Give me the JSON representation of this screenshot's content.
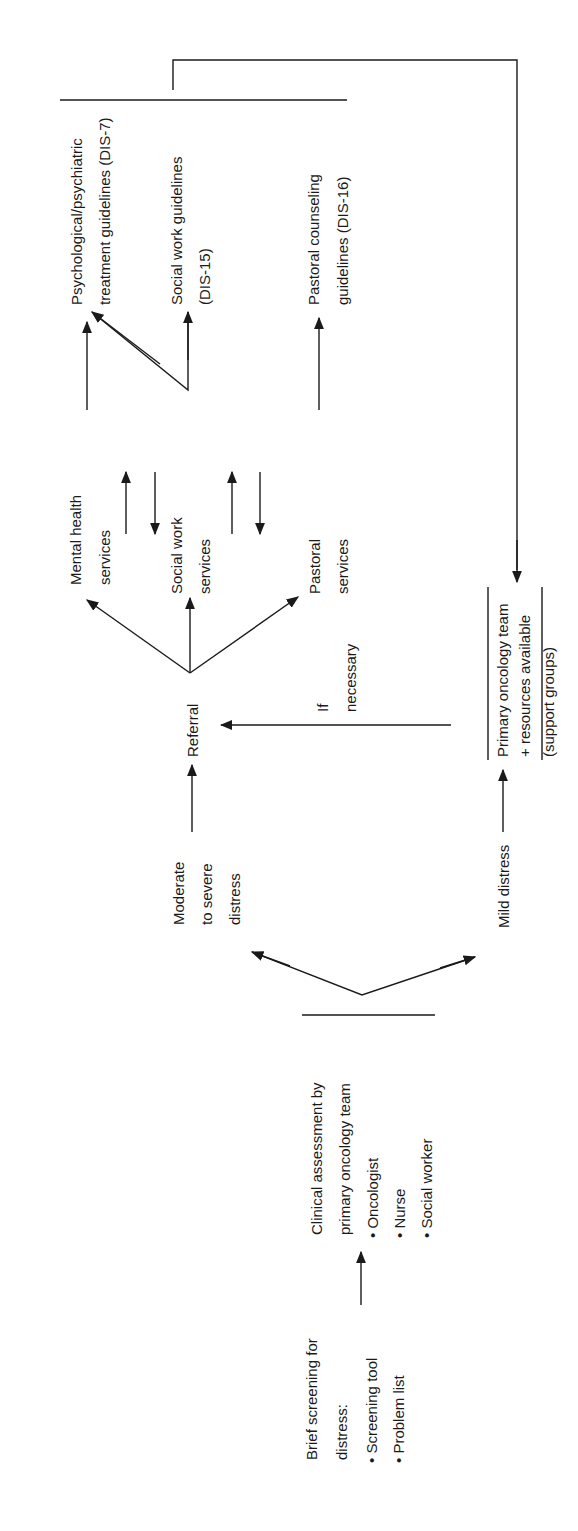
{
  "diagram": {
    "orientation": "rotated -90deg (reads bottom-to-top)",
    "nodes": {
      "screening": {
        "title_lines": [
          "Brief screening for",
          "distress:"
        ],
        "bullets": [
          "• Screening tool",
          "• Problem list"
        ]
      },
      "assessment": {
        "title_lines": [
          "Clinical assessment by",
          "primary oncology team"
        ],
        "bullets": [
          "• Oncologist",
          "• Nurse",
          "• Social worker"
        ]
      },
      "moderate": {
        "lines": [
          "Moderate",
          "to severe",
          "distress"
        ]
      },
      "mild": {
        "lines": [
          "Mild distress"
        ]
      },
      "referral": {
        "lines": [
          "Referral"
        ]
      },
      "primary_team": {
        "lines": [
          "Primary oncology team",
          "+ resources available",
          "(support groups)"
        ]
      },
      "if_necessary": {
        "lines": [
          "If",
          "necessary"
        ]
      },
      "mental_health": {
        "lines": [
          "Mental health",
          "services"
        ]
      },
      "social_work": {
        "lines": [
          "Social work",
          "services"
        ]
      },
      "pastoral": {
        "lines": [
          "Pastoral",
          "services"
        ]
      },
      "psych_guidelines": {
        "lines": [
          "Psychological/psychiatric",
          "treatment guidelines (DIS-7)"
        ]
      },
      "sw_guidelines": {
        "lines": [
          "Social work guidelines",
          "(DIS-15)"
        ]
      },
      "pastoral_guidelines": {
        "lines": [
          "Pastoral counseling",
          "guidelines (DIS-16)"
        ]
      }
    },
    "edges": [
      {
        "from": "screening",
        "to": "assessment"
      },
      {
        "from": "assessment",
        "to": "moderate"
      },
      {
        "from": "assessment",
        "to": "mild"
      },
      {
        "from": "moderate",
        "to": "referral"
      },
      {
        "from": "mild",
        "to": "primary_team"
      },
      {
        "from": "primary_team",
        "to": "referral",
        "label": "If necessary"
      },
      {
        "from": "referral",
        "to": "mental_health"
      },
      {
        "from": "referral",
        "to": "social_work"
      },
      {
        "from": "referral",
        "to": "pastoral"
      },
      {
        "from": "mental_health",
        "to": "social_work",
        "bidirectional": true
      },
      {
        "from": "social_work",
        "to": "pastoral",
        "bidirectional": true
      },
      {
        "from": "mental_health",
        "to": "psych_guidelines"
      },
      {
        "from": "social_work",
        "to": "psych_guidelines"
      },
      {
        "from": "social_work",
        "to": "sw_guidelines"
      },
      {
        "from": "pastoral",
        "to": "pastoral_guidelines"
      },
      {
        "from": "guidelines_group",
        "to": "primary_team"
      }
    ]
  }
}
